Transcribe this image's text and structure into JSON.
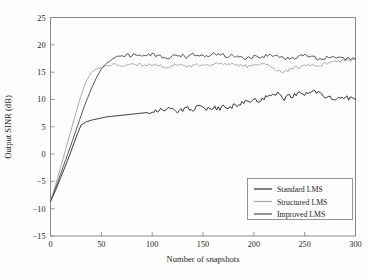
{
  "chart_data": {
    "type": "line",
    "title": "",
    "xlabel": "Number of snapshots",
    "ylabel": "Output SINR (dB)",
    "xlim": [
      0,
      300
    ],
    "ylim": [
      -15,
      25
    ],
    "xticks": [
      0,
      50,
      100,
      150,
      200,
      250,
      300
    ],
    "yticks": [
      -15,
      -10,
      -5,
      0,
      5,
      10,
      15,
      20,
      25
    ],
    "xtick_labels": [
      "0",
      "50",
      "100",
      "150",
      "200",
      "250",
      "300"
    ],
    "ytick_labels": [
      "-15",
      "-10",
      "-5",
      "0",
      "5",
      "10",
      "15",
      "20",
      "25"
    ],
    "grid": false,
    "legend_position": "lower right",
    "legend_entries": [
      "Standard LMS",
      "Structured LMS",
      "Improved LMS"
    ],
    "series": [
      {
        "name": "Standard LMS",
        "color": "#2b2b2b",
        "x": [
          0,
          5,
          10,
          15,
          20,
          25,
          30,
          35,
          40,
          45,
          50,
          55,
          60,
          65,
          70,
          75,
          80,
          85,
          90,
          95,
          100,
          105,
          110,
          115,
          120,
          125,
          130,
          135,
          140,
          145,
          150,
          155,
          160,
          165,
          170,
          175,
          180,
          185,
          190,
          195,
          200,
          205,
          210,
          215,
          220,
          225,
          230,
          235,
          240,
          245,
          250,
          255,
          260,
          265,
          270,
          275,
          280,
          285,
          290,
          295,
          300
        ],
        "values": [
          -8.7,
          -6.6,
          -4.3,
          -2.0,
          0.4,
          3.0,
          5.3,
          5.9,
          6.2,
          6.4,
          6.6,
          6.8,
          6.9,
          7.0,
          7.1,
          7.2,
          7.3,
          7.4,
          7.5,
          7.6,
          7.8,
          8.0,
          8.2,
          8.4,
          8.3,
          7.9,
          8.1,
          8.6,
          8.0,
          9.3,
          8.4,
          8.2,
          8.5,
          8.3,
          8.6,
          8.4,
          8.9,
          8.7,
          9.6,
          9.4,
          10.0,
          9.9,
          10.3,
          10.6,
          11.3,
          10.9,
          10.2,
          10.6,
          10.8,
          11.0,
          10.9,
          11.2,
          11.5,
          11.1,
          10.4,
          10.3,
          10.0,
          10.4,
          10.6,
          10.1,
          10.0
        ]
      },
      {
        "name": "Structured LMS",
        "color": "#a8a8a8",
        "x": [
          0,
          5,
          10,
          15,
          20,
          25,
          30,
          35,
          40,
          45,
          50,
          55,
          60,
          65,
          70,
          75,
          80,
          85,
          90,
          95,
          100,
          105,
          110,
          115,
          120,
          125,
          130,
          135,
          140,
          145,
          150,
          155,
          160,
          165,
          170,
          175,
          180,
          185,
          190,
          195,
          200,
          205,
          210,
          215,
          220,
          225,
          230,
          235,
          240,
          245,
          250,
          255,
          260,
          265,
          270,
          275,
          280,
          285,
          290,
          295,
          300
        ],
        "values": [
          -8.7,
          -5.6,
          -2.4,
          0.9,
          4.2,
          7.6,
          10.7,
          13.3,
          14.9,
          15.6,
          15.8,
          16.2,
          16.3,
          16.4,
          16.3,
          16.2,
          16.3,
          16.4,
          16.3,
          16.2,
          16.3,
          16.2,
          16.1,
          16.0,
          16.2,
          16.3,
          16.2,
          16.1,
          16.2,
          16.4,
          16.3,
          16.2,
          16.4,
          16.5,
          16.4,
          16.3,
          16.4,
          16.3,
          16.2,
          16.1,
          16.3,
          16.2,
          16.4,
          16.0,
          15.6,
          15.2,
          15.0,
          15.4,
          15.8,
          16.0,
          16.2,
          16.4,
          16.3,
          16.2,
          16.5,
          16.6,
          16.8,
          17.0,
          17.2,
          17.1,
          17.3
        ]
      },
      {
        "name": "Improved LMS",
        "color": "#4d4d4d",
        "x": [
          0,
          5,
          10,
          15,
          20,
          25,
          30,
          35,
          40,
          45,
          50,
          55,
          60,
          65,
          70,
          75,
          80,
          85,
          90,
          95,
          100,
          105,
          110,
          115,
          120,
          125,
          130,
          135,
          140,
          145,
          150,
          155,
          160,
          165,
          170,
          175,
          180,
          185,
          190,
          195,
          200,
          205,
          210,
          215,
          220,
          225,
          230,
          235,
          240,
          245,
          250,
          255,
          260,
          265,
          270,
          275,
          280,
          285,
          290,
          295,
          300
        ],
        "values": [
          -8.7,
          -6.2,
          -3.6,
          -1.0,
          1.6,
          4.3,
          7.0,
          9.6,
          11.9,
          13.9,
          15.6,
          16.6,
          17.2,
          17.6,
          17.9,
          18.0,
          18.1,
          18.2,
          18.1,
          18.0,
          18.2,
          18.1,
          17.8,
          17.6,
          17.9,
          18.1,
          18.0,
          17.7,
          18.2,
          18.3,
          18.1,
          18.0,
          18.4,
          18.3,
          18.1,
          17.9,
          18.0,
          17.6,
          17.4,
          17.6,
          17.8,
          17.7,
          17.9,
          18.1,
          18.2,
          17.9,
          17.6,
          17.4,
          17.6,
          17.8,
          18.0,
          17.8,
          17.6,
          17.4,
          17.6,
          17.8,
          17.7,
          17.5,
          17.3,
          17.4,
          17.3
        ]
      }
    ]
  },
  "axes": {
    "xlabel": "Number of snapshots",
    "ylabel": "Output SINR (dB)"
  },
  "legend": {
    "items": [
      {
        "label": "Standard LMS",
        "color": "#2b2b2b"
      },
      {
        "label": "Structured LMS",
        "color": "#a8a8a8"
      },
      {
        "label": "Improved LMS",
        "color": "#4d4d4d"
      }
    ]
  },
  "ticks": {
    "x": [
      "0",
      "50",
      "100",
      "150",
      "200",
      "250",
      "300"
    ],
    "y": [
      "25",
      "20",
      "15",
      "10",
      "5",
      "0",
      "-5",
      "-10",
      "-15"
    ]
  },
  "colors": {
    "background": "#fefefe",
    "axis": "#8a8a8a",
    "text": "#231f20"
  }
}
